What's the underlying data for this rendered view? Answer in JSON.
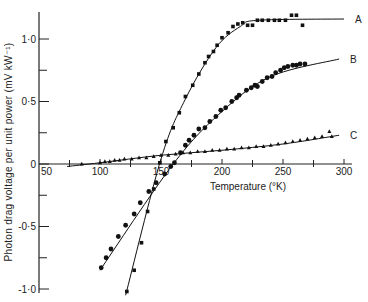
{
  "chart_data": {
    "type": "scatter",
    "title": "",
    "xlabel": "Temperature (°K)",
    "ylabel": "Photon drag voltage per unit power (mV kW⁻¹)",
    "xlim": [
      50,
      310
    ],
    "ylim": [
      -1.0,
      1.2
    ],
    "x_ticks": [
      50,
      100,
      150,
      200,
      250,
      300
    ],
    "x_minor_ticks": [
      75,
      125,
      175,
      225,
      275
    ],
    "x_tick_labels": [
      "50",
      "100",
      "150",
      "200",
      "250",
      "300"
    ],
    "y_ticks": [
      -1.0,
      -0.5,
      0,
      0.5,
      1.0
    ],
    "y_minor_ticks": [
      -0.75,
      -0.25,
      0.25,
      0.75
    ],
    "y_tick_labels": [
      "-1·0",
      "-0·5",
      "0",
      "0·5",
      "1·0"
    ],
    "grid": false,
    "legend_position": "inline labels at right end of curves",
    "series": [
      {
        "name": "A",
        "marker": "square",
        "points": [
          [
            122,
            -1.02
          ],
          [
            128,
            -0.85
          ],
          [
            134,
            -0.63
          ],
          [
            139,
            -0.38
          ],
          [
            144,
            -0.2
          ],
          [
            149,
            0.01
          ],
          [
            154,
            0.18
          ],
          [
            160,
            0.29
          ],
          [
            165,
            0.41
          ],
          [
            170,
            0.54
          ],
          [
            176,
            0.63
          ],
          [
            181,
            0.72
          ],
          [
            186,
            0.81
          ],
          [
            189,
            0.86
          ],
          [
            193,
            0.9
          ],
          [
            196,
            0.95
          ],
          [
            200,
            1.01
          ],
          [
            205,
            1.05
          ],
          [
            209,
            1.1
          ],
          [
            213,
            1.12
          ],
          [
            217,
            1.13
          ],
          [
            221,
            1.11
          ],
          [
            225,
            1.11
          ],
          [
            229,
            1.15
          ],
          [
            233,
            1.15
          ],
          [
            238,
            1.15
          ],
          [
            243,
            1.15
          ],
          [
            247,
            1.15
          ],
          [
            252,
            1.15
          ],
          [
            257,
            1.19
          ],
          [
            261,
            1.19
          ],
          [
            266,
            1.11
          ]
        ],
        "fit": [
          [
            121,
            -1.05
          ],
          [
            150,
            0.04
          ],
          [
            170,
            0.52
          ],
          [
            195,
            0.93
          ],
          [
            215,
            1.1
          ],
          [
            230,
            1.15
          ],
          [
            300,
            1.16
          ]
        ]
      },
      {
        "name": "B",
        "marker": "circle",
        "points": [
          [
            101,
            -0.83
          ],
          [
            105,
            -0.75
          ],
          [
            109,
            -0.68
          ],
          [
            115,
            -0.58
          ],
          [
            121,
            -0.49
          ],
          [
            128,
            -0.4
          ],
          [
            133,
            -0.31
          ],
          [
            140,
            -0.22
          ],
          [
            146,
            -0.15
          ],
          [
            153,
            -0.08
          ],
          [
            158,
            -0.02
          ],
          [
            161,
            0.01
          ],
          [
            166,
            0.09
          ],
          [
            170,
            0.15
          ],
          [
            173,
            0.19
          ],
          [
            177,
            0.23
          ],
          [
            181,
            0.28
          ],
          [
            186,
            0.29
          ],
          [
            190,
            0.34
          ],
          [
            195,
            0.38
          ],
          [
            199,
            0.43
          ],
          [
            203,
            0.45
          ],
          [
            208,
            0.5
          ],
          [
            212,
            0.53
          ],
          [
            214,
            0.55
          ],
          [
            220,
            0.59
          ],
          [
            224,
            0.61
          ],
          [
            227,
            0.63
          ],
          [
            229,
            0.62
          ],
          [
            233,
            0.66
          ],
          [
            237,
            0.69
          ],
          [
            241,
            0.7
          ],
          [
            244,
            0.73
          ],
          [
            248,
            0.75
          ],
          [
            251,
            0.77
          ],
          [
            254,
            0.78
          ],
          [
            258,
            0.79
          ],
          [
            261,
            0.79
          ],
          [
            264,
            0.8
          ],
          [
            268,
            0.8
          ]
        ],
        "fit": [
          [
            100,
            -0.85
          ],
          [
            160,
            0.0
          ],
          [
            200,
            0.42
          ],
          [
            240,
            0.7
          ],
          [
            296,
            0.84
          ]
        ]
      },
      {
        "name": "C",
        "marker": "triangle",
        "points": [
          [
            85,
            0.0
          ],
          [
            100,
            0.01
          ],
          [
            104,
            0.02
          ],
          [
            108,
            0.02
          ],
          [
            112,
            0.03
          ],
          [
            116,
            0.03
          ],
          [
            120,
            0.04
          ],
          [
            126,
            0.04
          ],
          [
            132,
            0.05
          ],
          [
            138,
            0.05
          ],
          [
            144,
            0.06
          ],
          [
            150,
            0.07
          ],
          [
            156,
            0.07
          ],
          [
            162,
            0.08
          ],
          [
            168,
            0.09
          ],
          [
            174,
            0.09
          ],
          [
            180,
            0.1
          ],
          [
            186,
            0.1
          ],
          [
            192,
            0.11
          ],
          [
            198,
            0.11
          ],
          [
            204,
            0.12
          ],
          [
            210,
            0.12
          ],
          [
            216,
            0.13
          ],
          [
            222,
            0.13
          ],
          [
            228,
            0.14
          ],
          [
            234,
            0.14
          ],
          [
            240,
            0.15
          ],
          [
            246,
            0.16
          ],
          [
            252,
            0.17
          ],
          [
            258,
            0.18
          ],
          [
            264,
            0.19
          ],
          [
            270,
            0.2
          ],
          [
            276,
            0.21
          ],
          [
            282,
            0.22
          ],
          [
            288,
            0.26
          ],
          [
            290,
            0.22
          ]
        ],
        "fit": [
          [
            73,
            -0.02
          ],
          [
            100,
            0.01
          ],
          [
            150,
            0.07
          ],
          [
            200,
            0.11
          ],
          [
            250,
            0.16
          ],
          [
            296,
            0.23
          ]
        ]
      }
    ]
  }
}
